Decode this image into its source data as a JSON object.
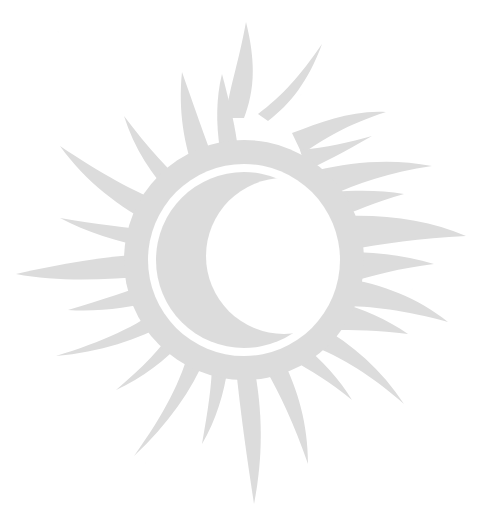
{
  "image": {
    "title": "Sun with crescent moon eclipse emblem",
    "alt_text": "Stylised sun with flame-like rays surrounding a ring; inside the ring a crescent moon",
    "width": 485,
    "height": 526,
    "background_color": "#ffffff",
    "figure_color": "#dcdcdc",
    "ring_color": "#ffffff",
    "style": "flat silhouette, very light grey, scanned artwork"
  },
  "artwork": {
    "center_x": 244,
    "center_y": 260,
    "disc_radius": 118,
    "ring_outer_radius": 96,
    "ring_inner_radius": 88,
    "ray_count": 22,
    "ray_outer_radius_long": 205,
    "ray_outer_radius_short": 150,
    "crescent": {
      "outer_radius": 88,
      "inner_offset_x": 40,
      "inner_radius": 78,
      "orientation": "waning-left"
    },
    "labels": {
      "sun_body": "sun-disc",
      "rays": "sun-rays",
      "ring": "eclipse-ring",
      "moon": "crescent-moon"
    }
  }
}
